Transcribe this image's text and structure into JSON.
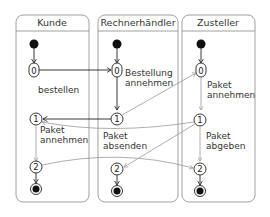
{
  "lanes": [
    {
      "name": "Kunde"
    },
    {
      "name": "Rechnerhändler"
    },
    {
      "name": "Zusteller"
    }
  ],
  "states": {
    "kunde": [
      "0",
      "1",
      "2"
    ],
    "rechner": [
      "0",
      "1",
      "2"
    ],
    "zusteller": [
      "0",
      "1",
      "2"
    ]
  },
  "labels": {
    "bestellen": "bestellen",
    "bestellung_1": "Bestellung",
    "bestellung_2": "annehmen",
    "kunde_paket_1": "Paket",
    "kunde_paket_2": "annehmen",
    "rechner_paket_1": "Paket",
    "rechner_paket_2": "absenden",
    "zust_annehmen_1": "Paket",
    "zust_annehmen_2": "annehmen",
    "zust_abgeben_1": "Paket",
    "zust_abgeben_2": "abgeben"
  },
  "colors": {
    "primary_line": "#222222",
    "secondary_line": "#9a9a9a",
    "lane_border": "#888888"
  }
}
